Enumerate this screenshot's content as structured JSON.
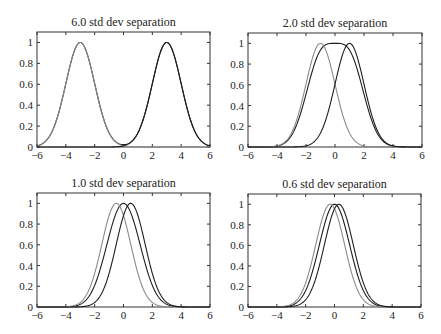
{
  "chart_data": [
    {
      "type": "line",
      "title": "6.0 std dev separation",
      "separation_std": 6.0,
      "xlabel": "",
      "ylabel": "",
      "xlim": [
        -6,
        6
      ],
      "ylim": [
        0,
        1.1
      ],
      "xticks": [
        -6,
        -4,
        -2,
        0,
        2,
        4,
        6
      ],
      "yticks": [
        0,
        0.2,
        0.4,
        0.6,
        0.8,
        1
      ],
      "grid": false,
      "series": [
        {
          "name": "gaussian-left",
          "mean": -3.0,
          "std": 1,
          "peak": 1,
          "color": "#8a8a8a"
        },
        {
          "name": "gaussian-right",
          "mean": 3.0,
          "std": 1,
          "peak": 1,
          "color": "#1e1e1e"
        },
        {
          "name": "normalized-sum",
          "color": "#1e1e1e",
          "note": "coincides with individual peaks"
        }
      ],
      "box": {
        "x0": 37,
        "x1": 210,
        "y0": 32,
        "y1": 147
      }
    },
    {
      "type": "line",
      "title": "2.0 std dev separation",
      "separation_std": 2.0,
      "xlabel": "",
      "ylabel": "",
      "xlim": [
        -6,
        6
      ],
      "ylim": [
        0,
        1.1
      ],
      "xticks": [
        -6,
        -4,
        -2,
        0,
        2,
        4,
        6
      ],
      "yticks": [
        0,
        0.2,
        0.4,
        0.6,
        0.8,
        1
      ],
      "grid": false,
      "series": [
        {
          "name": "gaussian-left",
          "mean": -1.0,
          "std": 1,
          "peak": 1,
          "color": "#8a8a8a"
        },
        {
          "name": "gaussian-right",
          "mean": 1.0,
          "std": 1,
          "peak": 1,
          "color": "#1e1e1e"
        },
        {
          "name": "normalized-sum",
          "color": "#1e1e1e",
          "center_dip": 0.73
        }
      ],
      "box": {
        "x0": 248,
        "x1": 422,
        "y0": 33,
        "y1": 147
      }
    },
    {
      "type": "line",
      "title": "1.0 std dev separation",
      "separation_std": 1.0,
      "xlabel": "",
      "ylabel": "",
      "xlim": [
        -6,
        6
      ],
      "ylim": [
        0,
        1.1
      ],
      "xticks": [
        -6,
        -4,
        -2,
        0,
        2,
        4,
        6
      ],
      "yticks": [
        0,
        0.2,
        0.4,
        0.6,
        0.8,
        1
      ],
      "grid": false,
      "series": [
        {
          "name": "gaussian-left",
          "mean": -0.5,
          "std": 1,
          "peak": 1,
          "color": "#8a8a8a"
        },
        {
          "name": "gaussian-right",
          "mean": 0.5,
          "std": 1,
          "peak": 1,
          "color": "#1e1e1e"
        },
        {
          "name": "normalized-sum",
          "color": "#1e1e1e",
          "peak_at": 0
        }
      ],
      "box": {
        "x0": 37,
        "x1": 210,
        "y0": 193,
        "y1": 307
      }
    },
    {
      "type": "line",
      "title": "0.6 std dev separation",
      "separation_std": 0.6,
      "xlabel": "",
      "ylabel": "",
      "xlim": [
        -6,
        6
      ],
      "ylim": [
        0,
        1.1
      ],
      "xticks": [
        -6,
        -4,
        -2,
        0,
        2,
        4,
        6
      ],
      "yticks": [
        0,
        0.2,
        0.4,
        0.6,
        0.8,
        1
      ],
      "grid": false,
      "series": [
        {
          "name": "gaussian-left",
          "mean": -0.3,
          "std": 1,
          "peak": 1,
          "color": "#8a8a8a"
        },
        {
          "name": "gaussian-right",
          "mean": 0.3,
          "std": 1,
          "peak": 1,
          "color": "#1e1e1e"
        },
        {
          "name": "normalized-sum",
          "color": "#1e1e1e",
          "peak_at": 0
        }
      ],
      "box": {
        "x0": 248,
        "x1": 421,
        "y0": 194,
        "y1": 307
      }
    }
  ],
  "panels": [
    {
      "title": "6.0 std dev separation"
    },
    {
      "title": "2.0 std dev separation"
    },
    {
      "title": "1.0 std dev separation"
    },
    {
      "title": "0.6 std dev separation"
    }
  ],
  "tick_labels": {
    "x": [
      "−6",
      "−4",
      "−2",
      "0",
      "2",
      "4",
      "6"
    ],
    "y": [
      "0",
      "0.2",
      "0.4",
      "0.6",
      "0.8",
      "1"
    ]
  },
  "colors": {
    "axis": "#333333",
    "curve_light": "#8a8a8a",
    "curve_dark": "#1e1e1e",
    "background": "#ffffff"
  }
}
